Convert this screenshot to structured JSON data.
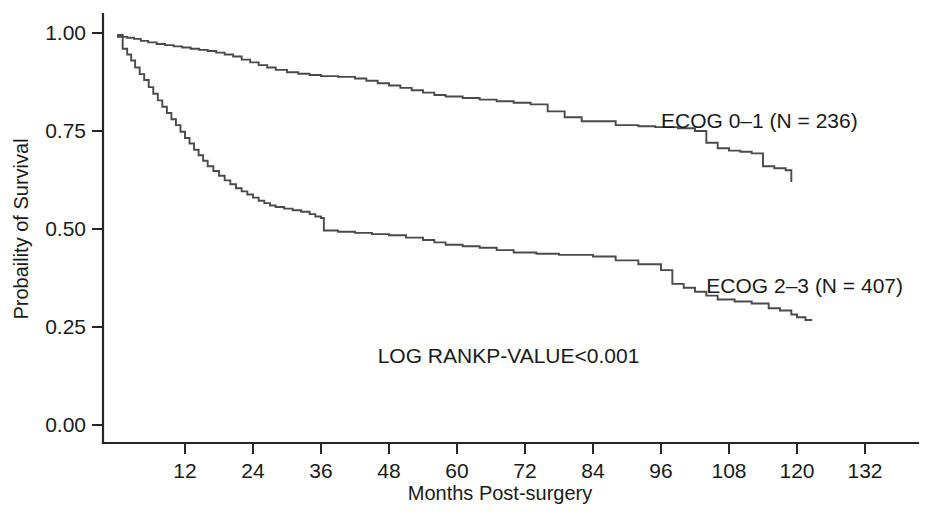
{
  "chart_data": {
    "type": "line",
    "subtype": "kaplan-meier-step",
    "title": "",
    "xlabel": "Months Post-surgery",
    "ylabel": "Probaility of Survival",
    "xlim": [
      0,
      138
    ],
    "ylim": [
      0.0,
      1.0
    ],
    "grid": false,
    "legend_position": "inline-right-of-curves",
    "x_ticks": [
      12,
      24,
      36,
      48,
      60,
      72,
      84,
      96,
      108,
      120,
      132
    ],
    "x_tick_labels": [
      "12",
      "24",
      "36",
      "48",
      "60",
      "72",
      "84",
      "96",
      "108",
      "120",
      "132"
    ],
    "y_ticks": [
      0.0,
      0.25,
      0.5,
      0.75,
      1.0
    ],
    "y_tick_labels": [
      "0.00",
      "0.25",
      "0.50",
      "0.75",
      "1.00"
    ],
    "annotations": [
      {
        "name": "log-rank-p-value",
        "text": "LOG RANKP-VALUE<0.001",
        "x": 46,
        "y": 0.175
      }
    ],
    "series": [
      {
        "name": "ECOG 0-1",
        "label": "ECOG 0–1 (N = 236)",
        "n": 236,
        "color": "#4a4a4a",
        "label_x": 96,
        "label_y": 0.775,
        "points": [
          [
            0.0,
            0.995
          ],
          [
            1.0,
            0.99
          ],
          [
            1.8,
            0.988
          ],
          [
            3.0,
            0.985
          ],
          [
            4.2,
            0.98
          ],
          [
            5.5,
            0.976
          ],
          [
            7.0,
            0.972
          ],
          [
            8.5,
            0.969
          ],
          [
            10.0,
            0.966
          ],
          [
            11.5,
            0.963
          ],
          [
            13.0,
            0.96
          ],
          [
            14.5,
            0.957
          ],
          [
            16.0,
            0.954
          ],
          [
            17.5,
            0.95
          ],
          [
            19.0,
            0.945
          ],
          [
            20.5,
            0.94
          ],
          [
            22.0,
            0.932
          ],
          [
            23.5,
            0.925
          ],
          [
            25.0,
            0.918
          ],
          [
            26.5,
            0.912
          ],
          [
            28.0,
            0.906
          ],
          [
            30.0,
            0.9
          ],
          [
            32.0,
            0.896
          ],
          [
            34.0,
            0.893
          ],
          [
            36.0,
            0.89
          ],
          [
            39.0,
            0.888
          ],
          [
            42.0,
            0.884
          ],
          [
            44.0,
            0.878
          ],
          [
            46.0,
            0.872
          ],
          [
            48.0,
            0.866
          ],
          [
            50.0,
            0.86
          ],
          [
            52.0,
            0.854
          ],
          [
            54.0,
            0.848
          ],
          [
            56.0,
            0.842
          ],
          [
            58.0,
            0.838
          ],
          [
            61.0,
            0.834
          ],
          [
            64.0,
            0.83
          ],
          [
            67.0,
            0.826
          ],
          [
            70.0,
            0.822
          ],
          [
            73.0,
            0.818
          ],
          [
            76.0,
            0.8
          ],
          [
            79.0,
            0.785
          ],
          [
            82.0,
            0.775
          ],
          [
            88.0,
            0.765
          ],
          [
            92.0,
            0.762
          ],
          [
            95.0,
            0.76
          ],
          [
            99.0,
            0.757
          ],
          [
            102.0,
            0.75
          ],
          [
            104.0,
            0.72
          ],
          [
            106.0,
            0.706
          ],
          [
            108.0,
            0.7
          ],
          [
            110.0,
            0.697
          ],
          [
            112.0,
            0.693
          ],
          [
            114.0,
            0.66
          ],
          [
            116.0,
            0.655
          ],
          [
            118.0,
            0.65
          ],
          [
            119.0,
            0.62
          ]
        ]
      },
      {
        "name": "ECOG 2-3",
        "label": "ECOG 2–3 (N = 407)",
        "n": 407,
        "color": "#4a4a4a",
        "label_x": 104,
        "label_y": 0.355,
        "points": [
          [
            0.0,
            0.99
          ],
          [
            1.0,
            0.96
          ],
          [
            1.8,
            0.945
          ],
          [
            2.5,
            0.93
          ],
          [
            3.2,
            0.912
          ],
          [
            4.0,
            0.895
          ],
          [
            4.8,
            0.88
          ],
          [
            5.6,
            0.862
          ],
          [
            6.4,
            0.845
          ],
          [
            7.2,
            0.828
          ],
          [
            8.0,
            0.812
          ],
          [
            8.8,
            0.796
          ],
          [
            9.6,
            0.78
          ],
          [
            10.4,
            0.765
          ],
          [
            11.2,
            0.748
          ],
          [
            12.0,
            0.732
          ],
          [
            12.8,
            0.718
          ],
          [
            13.6,
            0.702
          ],
          [
            14.4,
            0.688
          ],
          [
            15.2,
            0.674
          ],
          [
            16.0,
            0.66
          ],
          [
            17.0,
            0.648
          ],
          [
            18.0,
            0.636
          ],
          [
            19.0,
            0.624
          ],
          [
            20.0,
            0.614
          ],
          [
            21.0,
            0.604
          ],
          [
            22.0,
            0.596
          ],
          [
            23.0,
            0.588
          ],
          [
            24.0,
            0.58
          ],
          [
            25.0,
            0.572
          ],
          [
            26.0,
            0.566
          ],
          [
            27.0,
            0.56
          ],
          [
            28.0,
            0.556
          ],
          [
            29.5,
            0.552
          ],
          [
            31.0,
            0.548
          ],
          [
            32.5,
            0.544
          ],
          [
            34.0,
            0.538
          ],
          [
            35.0,
            0.532
          ],
          [
            36.0,
            0.528
          ],
          [
            36.5,
            0.496
          ],
          [
            39.0,
            0.493
          ],
          [
            42.0,
            0.49
          ],
          [
            45.0,
            0.487
          ],
          [
            48.0,
            0.484
          ],
          [
            51.0,
            0.478
          ],
          [
            54.0,
            0.472
          ],
          [
            56.0,
            0.466
          ],
          [
            58.0,
            0.46
          ],
          [
            61.0,
            0.456
          ],
          [
            64.0,
            0.452
          ],
          [
            67.0,
            0.446
          ],
          [
            70.0,
            0.44
          ],
          [
            74.0,
            0.437
          ],
          [
            78.0,
            0.434
          ],
          [
            84.0,
            0.43
          ],
          [
            88.0,
            0.42
          ],
          [
            92.0,
            0.41
          ],
          [
            96.0,
            0.395
          ],
          [
            98.0,
            0.36
          ],
          [
            100.0,
            0.35
          ],
          [
            102.0,
            0.34
          ],
          [
            104.0,
            0.33
          ],
          [
            106.0,
            0.32
          ],
          [
            109.0,
            0.315
          ],
          [
            112.0,
            0.31
          ],
          [
            115.0,
            0.298
          ],
          [
            117.0,
            0.292
          ],
          [
            119.0,
            0.282
          ],
          [
            120.0,
            0.275
          ],
          [
            121.5,
            0.268
          ],
          [
            122.5,
            0.265
          ]
        ]
      }
    ]
  },
  "axes": {
    "y_title": "Probaility of Survival",
    "x_title": "Months Post-surgery"
  }
}
